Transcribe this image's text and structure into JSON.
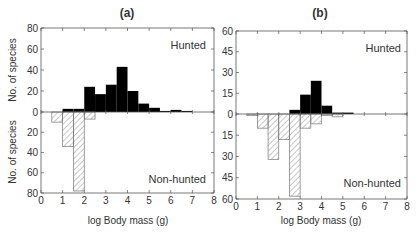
{
  "chart_data": [
    {
      "type": "bar",
      "panel": "(a)",
      "title": "(a)",
      "xlabel": "log Body mass (g)",
      "ylabel_upper": "No. of species",
      "ylabel_lower": "No. of species",
      "xlim": [
        0,
        8
      ],
      "xticks": [
        0,
        1,
        2,
        3,
        4,
        5,
        6,
        7
      ],
      "ylim_upper": [
        0,
        80
      ],
      "yticks_upper": [
        0,
        20,
        40,
        60,
        80
      ],
      "ylim_lower": [
        0,
        80
      ],
      "yticks_lower": [
        0,
        20,
        40,
        60,
        80
      ],
      "bin_width": 0.5,
      "grid": false,
      "series": [
        {
          "name": "Hunted",
          "style": "solid-black",
          "direction": "up",
          "bins": [
            {
              "x0": 1.0,
              "value": 3
            },
            {
              "x0": 1.5,
              "value": 3
            },
            {
              "x0": 2.0,
              "value": 24
            },
            {
              "x0": 2.5,
              "value": 17
            },
            {
              "x0": 3.0,
              "value": 26
            },
            {
              "x0": 3.5,
              "value": 43
            },
            {
              "x0": 4.0,
              "value": 20
            },
            {
              "x0": 4.5,
              "value": 8
            },
            {
              "x0": 5.0,
              "value": 4
            },
            {
              "x0": 5.5,
              "value": 1
            },
            {
              "x0": 6.0,
              "value": 2
            },
            {
              "x0": 6.5,
              "value": 1
            }
          ]
        },
        {
          "name": "Non-hunted",
          "style": "hatched",
          "direction": "down",
          "bins": [
            {
              "x0": 0.5,
              "value": 10
            },
            {
              "x0": 1.0,
              "value": 34
            },
            {
              "x0": 1.5,
              "value": 78
            },
            {
              "x0": 2.0,
              "value": 7
            }
          ]
        }
      ]
    },
    {
      "type": "bar",
      "panel": "(b)",
      "title": "(b)",
      "xlabel": "log Body mass (g)",
      "ylabel_upper": "",
      "ylabel_lower": "",
      "xlim": [
        0,
        8
      ],
      "xticks": [
        0,
        1,
        2,
        3,
        4,
        5,
        6,
        7,
        8
      ],
      "ylim_upper": [
        0,
        60
      ],
      "yticks_upper": [
        0,
        15,
        30,
        45,
        60
      ],
      "ylim_lower": [
        0,
        60
      ],
      "yticks_lower": [
        0,
        15,
        30,
        45,
        60
      ],
      "bin_width": 0.5,
      "grid": false,
      "series": [
        {
          "name": "Hunted",
          "style": "solid-black",
          "direction": "up",
          "bins": [
            {
              "x0": 2.5,
              "value": 3
            },
            {
              "x0": 3.0,
              "value": 14
            },
            {
              "x0": 3.5,
              "value": 24
            },
            {
              "x0": 4.0,
              "value": 6
            },
            {
              "x0": 4.5,
              "value": 1
            },
            {
              "x0": 5.0,
              "value": 1
            }
          ]
        },
        {
          "name": "Non-hunted",
          "style": "hatched",
          "direction": "down",
          "bins": [
            {
              "x0": 0.5,
              "value": 1
            },
            {
              "x0": 1.0,
              "value": 10
            },
            {
              "x0": 1.5,
              "value": 32
            },
            {
              "x0": 2.0,
              "value": 18
            },
            {
              "x0": 2.5,
              "value": 58
            },
            {
              "x0": 3.0,
              "value": 10
            },
            {
              "x0": 3.5,
              "value": 7
            },
            {
              "x0": 4.0,
              "value": 1
            },
            {
              "x0": 4.5,
              "value": 2
            }
          ]
        }
      ]
    }
  ],
  "labels": {
    "panel_a_title": "(a)",
    "panel_b_title": "(b)",
    "hunted": "Hunted",
    "non_hunted": "Non-hunted",
    "xlabel": "log Body mass (g)",
    "ylabel": "No. of species"
  },
  "colors": {
    "bar_fill": "#000000",
    "hatch": "#777777",
    "axis": "#555555",
    "text": "#333333"
  }
}
